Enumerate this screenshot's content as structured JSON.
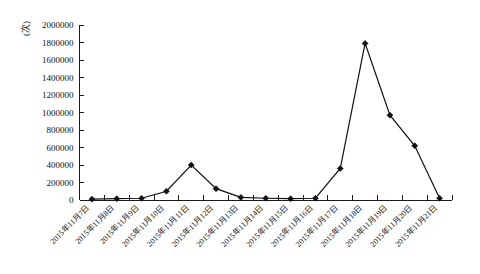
{
  "chart_data": {
    "type": "line",
    "title": "",
    "subtitle": "",
    "xlabel": "",
    "ylabel": "(次)",
    "ylim": [
      0,
      2000000
    ],
    "ytick_labels": [
      "2000000",
      "1800000",
      "1600000",
      "1400000",
      "1200000",
      "1000000",
      "800000",
      "600000",
      "400000",
      "200000",
      "0"
    ],
    "ytick_values": [
      2000000,
      1800000,
      1600000,
      1400000,
      1200000,
      1000000,
      800000,
      600000,
      400000,
      200000,
      0
    ],
    "grid": false,
    "legend": "none",
    "categories": [
      "2015年11月7日",
      "2015年11月8日",
      "2015年11月9日",
      "2015年11月10日",
      "2015年11月11日",
      "2015年11月12日",
      "2015年11月13日",
      "2015年11月14日",
      "2015年11月15日",
      "2015年11月16日",
      "2015年11月17日",
      "2015年11月18日",
      "2015年11月19日",
      "2015年11月20日",
      "2015年11月21日"
    ],
    "values": [
      10000,
      15000,
      20000,
      100000,
      400000,
      130000,
      30000,
      20000,
      15000,
      20000,
      360000,
      1790000,
      970000,
      620000,
      20000
    ],
    "marker": "diamond",
    "line_color": "#111111",
    "marker_color": "#111111"
  }
}
